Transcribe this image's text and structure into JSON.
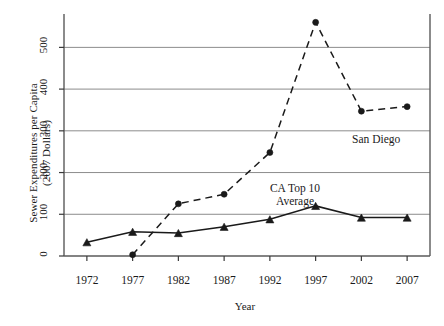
{
  "chart_data": {
    "type": "line",
    "title": "",
    "xlabel": "Year",
    "ylabel": "Sewer Expenditures per Capita\n(2007 Dollars)",
    "x": [
      1972,
      1977,
      1982,
      1987,
      1992,
      1997,
      2002,
      2007
    ],
    "xticklabels": [
      "1972",
      "1977",
      "1982",
      "1987",
      "1992",
      "1997",
      "2002",
      "2007"
    ],
    "yticklabels": [
      "0",
      "100",
      "200",
      "300",
      "400",
      "500"
    ],
    "yticks": [
      0,
      100,
      200,
      300,
      400,
      500
    ],
    "xlim": [
      1969.5,
      2009.5
    ],
    "ylim": [
      0,
      580
    ],
    "grid": "horizontal",
    "legend_position": "inline-annotations",
    "series": [
      {
        "name": "San Diego",
        "linestyle": "dashed",
        "marker": "circle",
        "color": "#1a1a1a",
        "values": [
          null,
          3,
          125,
          148,
          248,
          560,
          347,
          358
        ]
      },
      {
        "name": "CA Top 10 Average",
        "linestyle": "solid",
        "marker": "triangle",
        "color": "#1a1a1a",
        "values": [
          33,
          58,
          55,
          70,
          88,
          120,
          92,
          92
        ]
      }
    ],
    "annotations": [
      {
        "text": "San Diego",
        "x": 2002.6,
        "y": 318
      },
      {
        "text": "CA Top 10\nAverage",
        "x": 1996.4,
        "y": 172
      }
    ]
  }
}
